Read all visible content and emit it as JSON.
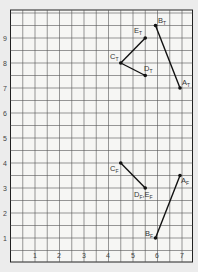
{
  "chart_data": {
    "type": "scatter",
    "title": "",
    "xlabel": "",
    "ylabel": "",
    "xlim": [
      0,
      7.5
    ],
    "ylim": [
      0,
      10
    ],
    "grid": "on (half-unit spacing)",
    "x_ticks": [
      "1",
      "2",
      "3",
      "4",
      "5",
      "6",
      "7"
    ],
    "y_ticks": [
      "1",
      "2",
      "3",
      "4",
      "5",
      "6",
      "7",
      "8",
      "9"
    ],
    "points": [
      {
        "name": "A",
        "sub": "T",
        "x": 7,
        "y": 7
      },
      {
        "name": "B",
        "sub": "T",
        "x": 6,
        "y": 9.5
      },
      {
        "name": "C",
        "sub": "T",
        "x": 4.5,
        "y": 8
      },
      {
        "name": "D",
        "sub": "T",
        "x": 5.5,
        "y": 7.5
      },
      {
        "name": "E",
        "sub": "T",
        "x": 5.5,
        "y": 9
      },
      {
        "name": "A",
        "sub": "F",
        "x": 7,
        "y": 3.5
      },
      {
        "name": "B",
        "sub": "F",
        "x": 6,
        "y": 1
      },
      {
        "name": "C",
        "sub": "F",
        "x": 4.5,
        "y": 4
      },
      {
        "name": "D,E",
        "sub": "F",
        "x": 5.5,
        "y": 3,
        "label": "DF,EF"
      }
    ],
    "segments": [
      {
        "from": "A_T",
        "to": "B_T"
      },
      {
        "from": "C_T",
        "to": "D_T"
      },
      {
        "from": "C_T",
        "to": "E_T"
      },
      {
        "from": "A_F",
        "to": "B_F"
      },
      {
        "from": "C_F",
        "to": "D_F"
      }
    ]
  },
  "labels": {
    "AT": {
      "main": "A",
      "sub": "T"
    },
    "BT": {
      "main": "B",
      "sub": "T"
    },
    "CT": {
      "main": "C",
      "sub": "T"
    },
    "DT": {
      "main": "D",
      "sub": "T"
    },
    "ET": {
      "main": "E",
      "sub": "T"
    },
    "AF": {
      "main": "A",
      "sub": "F"
    },
    "BF": {
      "main": "B",
      "sub": "F"
    },
    "CF": {
      "main": "C",
      "sub": "F"
    },
    "DF": {
      "main": "D",
      "sub": "F"
    },
    "EF": {
      "main": "E",
      "sub": "F"
    },
    "sep": ","
  },
  "ticks": {
    "x": [
      "1",
      "2",
      "3",
      "4",
      "5",
      "6",
      "7"
    ],
    "y": [
      "1",
      "2",
      "3",
      "4",
      "5",
      "6",
      "7",
      "8",
      "9"
    ]
  }
}
